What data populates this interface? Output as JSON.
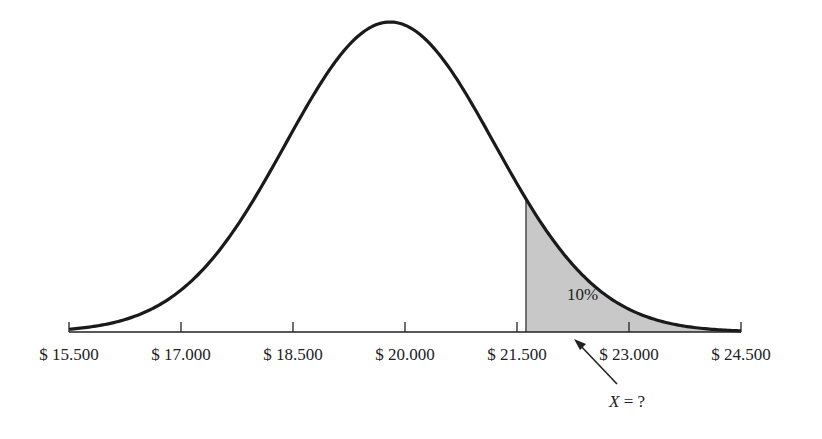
{
  "chart_data": {
    "type": "area",
    "title": "",
    "xlabel": "",
    "ylabel": "",
    "x_ticks": [
      "$ 15.500",
      "$ 17.000",
      "$ 18.500",
      "$ 20.000",
      "$ 21.500",
      "$ 23.000",
      "$ 24.500"
    ],
    "x_tick_values": [
      15500,
      17000,
      18500,
      20000,
      21500,
      23000,
      24500
    ],
    "xlim": [
      15500,
      24500
    ],
    "grid": false,
    "legend": null,
    "curve": {
      "distribution": "normal",
      "mean": 19800,
      "std_dev": 1400
    },
    "shaded_region": {
      "from": 21620,
      "to": 24500,
      "label": "10%",
      "color": "#c8c8c8"
    },
    "annotation": {
      "text": "X = ?",
      "points_to": 21620
    }
  },
  "labels": {
    "area": "10%",
    "x_variable": "X",
    "x_question": " = ?"
  },
  "colors": {
    "curve": "#1a1a1a",
    "fill": "#c8c8c8",
    "axis": "#222222"
  }
}
